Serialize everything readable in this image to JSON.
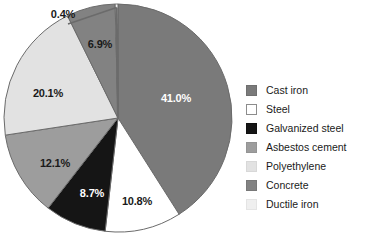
{
  "chart_data": {
    "type": "pie",
    "title": "",
    "subtitle": "",
    "xlabel": "",
    "ylabel": "",
    "legend_position": "right",
    "grid": false,
    "start_angle_deg": 0,
    "direction": "clockwise",
    "value_unit": "%",
    "categories": [
      "Cast iron",
      "Steel",
      "Galvanized steel",
      "Asbestos cement",
      "Polyethylene",
      "Concrete",
      "Ductile iron"
    ],
    "values": [
      41.0,
      10.8,
      8.7,
      12.1,
      20.1,
      6.9,
      0.4
    ],
    "labels": [
      "41.0%",
      "10.8%",
      "8.7%",
      "12.1%",
      "20.1%",
      "6.9%",
      "0.4%"
    ],
    "colors": [
      "#7a7a7a",
      "#ffffff",
      "#151515",
      "#9d9d9d",
      "#e2e2e2",
      "#828282",
      "#f2f2f2"
    ],
    "slices": [
      {
        "name": "Cast iron",
        "value": 41.0,
        "label": "41.0%",
        "color": "#7a7a7a",
        "label_color": "light",
        "label_x": 176,
        "label_y": 98,
        "has_leader": false
      },
      {
        "name": "Steel",
        "value": 10.8,
        "label": "10.8%",
        "color": "#ffffff",
        "label_color": "dark",
        "label_x": 137,
        "label_y": 201,
        "has_leader": false
      },
      {
        "name": "Galvanized steel",
        "value": 8.7,
        "label": "8.7%",
        "color": "#151515",
        "label_color": "light",
        "label_x": 92,
        "label_y": 193,
        "has_leader": false
      },
      {
        "name": "Asbestos cement",
        "value": 12.1,
        "label": "12.1%",
        "color": "#9d9d9d",
        "label_color": "dark",
        "label_x": 55,
        "label_y": 163,
        "has_leader": false
      },
      {
        "name": "Polyethylene",
        "value": 20.1,
        "label": "20.1%",
        "color": "#e2e2e2",
        "label_color": "dark",
        "label_x": 48,
        "label_y": 93,
        "has_leader": false
      },
      {
        "name": "Concrete",
        "value": 6.9,
        "label": "6.9%",
        "color": "#828282",
        "label_color": "dark",
        "label_x": 100,
        "label_y": 44,
        "has_leader": false
      },
      {
        "name": "Ductile iron",
        "value": 0.4,
        "label": "0.4%",
        "color": "#f2f2f2",
        "label_color": "dark",
        "label_x": 63,
        "label_y": 14,
        "has_leader": true
      }
    ]
  },
  "legend": {
    "items": [
      {
        "label": "Cast iron",
        "color": "#7a7a7a",
        "border": "#6f6f6f"
      },
      {
        "label": "Steel",
        "color": "#ffffff",
        "border": "#8c8c8c"
      },
      {
        "label": "Galvanized steel",
        "color": "#151515",
        "border": "#101010"
      },
      {
        "label": "Asbestos cement",
        "color": "#9d9d9d",
        "border": "#949494"
      },
      {
        "label": "Polyethylene",
        "color": "#e2e2e2",
        "border": "#d8d8d8"
      },
      {
        "label": "Concrete",
        "color": "#828282",
        "border": "#787878"
      },
      {
        "label": "Ductile iron",
        "color": "#efefef",
        "border": "#e4e4e4"
      }
    ]
  }
}
